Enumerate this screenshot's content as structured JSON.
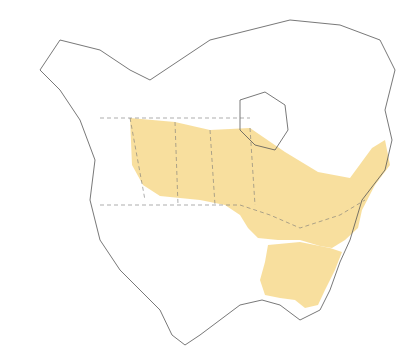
{
  "map": {
    "type": "species range map",
    "region": "North America",
    "range_color": "#f7dc94",
    "legend": []
  }
}
